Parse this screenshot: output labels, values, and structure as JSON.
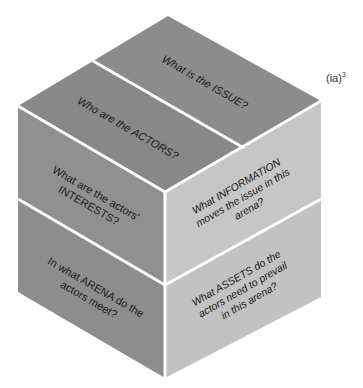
{
  "label": {
    "base": "(ia)",
    "exponent": "3"
  },
  "colors": {
    "top_face": "#8a8a8a",
    "left_face": "#8e8e8e",
    "right_face": "#c4c4c4",
    "divider": "#ffffff",
    "text": "#1a1a1a"
  },
  "faces": {
    "top": [
      {
        "lines": [
          "What is the ISSUE?"
        ]
      },
      {
        "lines": [
          "Who are the ACTORS?"
        ]
      }
    ],
    "left": [
      {
        "lines": [
          "What are the actors'",
          "INTERESTS?"
        ]
      },
      {
        "lines": [
          "In what ARENA do the",
          "actors meet?"
        ]
      }
    ],
    "right": [
      {
        "lines": [
          "What INFORMATION",
          "moves the issue in this",
          "arena?"
        ]
      },
      {
        "lines": [
          "What ASSETS do the",
          "actors need to prevail",
          "in this arena?"
        ]
      }
    ]
  }
}
